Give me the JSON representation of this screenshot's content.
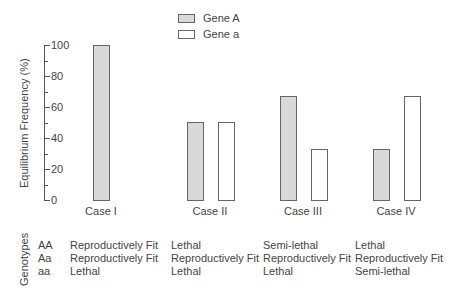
{
  "chart_data": {
    "type": "bar",
    "title": "",
    "xlabel": "",
    "ylabel": "Equilibrium Frequency (%)",
    "ylim": [
      0,
      100
    ],
    "yticks": [
      0,
      20,
      40,
      60,
      80,
      100
    ],
    "categories": [
      "Case I",
      "Case II",
      "Case III",
      "Case IV"
    ],
    "series": [
      {
        "name": "Gene A",
        "fill": "#d9d9d9",
        "values": [
          100,
          50,
          67,
          33
        ]
      },
      {
        "name": "Gene a",
        "fill": "#ffffff",
        "values": [
          0,
          50,
          33,
          67
        ]
      }
    ],
    "legend_position": "top-center",
    "grid": false
  },
  "legend": {
    "items": [
      {
        "label": "Gene A",
        "color": "#d9d9d9"
      },
      {
        "label": "Gene a",
        "color": "#ffffff"
      }
    ]
  },
  "genotype_table": {
    "title": "Genotypes",
    "genotypes": [
      "AA",
      "Aa",
      "aa"
    ],
    "cases": [
      {
        "case": "Case I",
        "values": [
          "Reproductively Fit",
          "Reproductively Fit",
          "Lethal"
        ]
      },
      {
        "case": "Case II",
        "values": [
          "Lethal",
          "Reproductively Fit",
          "Lethal"
        ]
      },
      {
        "case": "Case III",
        "values": [
          "Semi-lethal",
          "Reproductively Fit",
          "Lethal"
        ]
      },
      {
        "case": "Case IV",
        "values": [
          "Lethal",
          "Reproductively Fit",
          "Semi-lethal"
        ]
      }
    ]
  }
}
